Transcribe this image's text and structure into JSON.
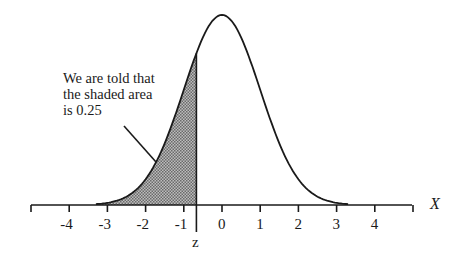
{
  "chart_data": {
    "type": "area",
    "title": "",
    "xlabel": "X",
    "ylabel": "",
    "x_ticks": [
      -4,
      -3,
      -2,
      -1,
      0,
      1,
      2,
      3,
      4
    ],
    "x_tick_labels": [
      "-4",
      "-3",
      "-2",
      "-1",
      "0",
      "1",
      "2",
      "3",
      "4"
    ],
    "xlim": [
      -5,
      5
    ],
    "distribution": {
      "name": "normal",
      "mean": 0,
      "sd": 1
    },
    "shaded_region": {
      "from": "-inf",
      "to": -0.67,
      "area": 0.25
    },
    "z_marker": {
      "label": "z",
      "x": -0.67
    },
    "annotation": [
      "We are told that",
      "the shaded area",
      "is 0.25"
    ]
  },
  "labels": {
    "x_axis": "X",
    "z": "z",
    "annotation_line1": "We are told that",
    "annotation_line2": "the shaded area",
    "annotation_line3": "is 0.25"
  },
  "ticks": [
    "-4",
    "-3",
    "-2",
    "-1",
    "0",
    "1",
    "2",
    "3",
    "4"
  ]
}
